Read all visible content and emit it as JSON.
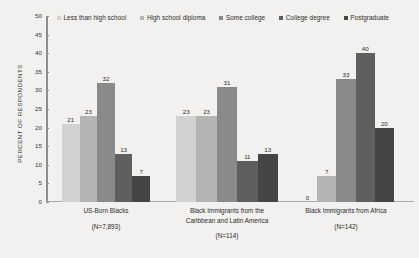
{
  "chart_data": {
    "type": "bar",
    "title": "",
    "subtitle": "",
    "xlabel": "",
    "ylabel": "PERCENT OF RESPONDENTS",
    "ylim": [
      0,
      50
    ],
    "ytick_labels": [
      "0",
      "5",
      "10",
      "15",
      "20",
      "25",
      "30",
      "35",
      "40",
      "45",
      "50"
    ],
    "ytick_values": [
      0,
      5,
      10,
      15,
      20,
      25,
      30,
      35,
      40,
      45,
      50
    ],
    "grid": false,
    "legend_position": "top",
    "categories": [
      "US-Born Blacks",
      "Black Immigrants from the Caribbean and Latin America",
      "Black Immigrants from Africa"
    ],
    "category_lines": [
      [
        "US-Born Blacks"
      ],
      [
        "Black Immigrants from the",
        "Caribbean and Latin America"
      ],
      [
        "Black Immigrants from Africa"
      ]
    ],
    "category_counts": [
      "(N=7,893)",
      "(N=114)",
      "(N=142)"
    ],
    "series": [
      {
        "name": "Less than high school",
        "color": "#d2d2d0",
        "values": [
          21,
          23,
          0
        ]
      },
      {
        "name": "High school diploma",
        "color": "#b4b4b2",
        "values": [
          23,
          23,
          7
        ]
      },
      {
        "name": "Some college",
        "color": "#8a8a88",
        "values": [
          32,
          31,
          33
        ]
      },
      {
        "name": "College degree",
        "color": "#5f5f5e",
        "values": [
          13,
          11,
          40
        ]
      },
      {
        "name": "Postgraduate",
        "color": "#454544",
        "values": [
          7,
          13,
          20
        ]
      }
    ]
  }
}
